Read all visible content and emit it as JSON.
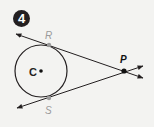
{
  "problem": {
    "number": "4"
  },
  "diagram": {
    "circle": {
      "center_label": "C",
      "cx": 41,
      "cy": 71,
      "r": 26
    },
    "points": {
      "R": {
        "label": "R",
        "x": 49,
        "y": 45,
        "color": "#9a9a9a"
      },
      "S": {
        "label": "S",
        "x": 49,
        "y": 98,
        "color": "#9a9a9a"
      },
      "P": {
        "label": "P",
        "x": 124,
        "y": 71,
        "color": "#111111"
      }
    },
    "tangent_lines": [
      "line RP",
      "line SP"
    ],
    "colors": {
      "stroke": "#231f20",
      "tangent_point": "#9a9a9a",
      "background": "#f3f3f1"
    }
  }
}
